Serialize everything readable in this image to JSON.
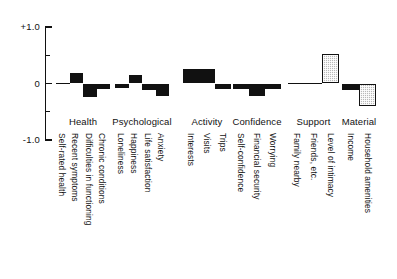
{
  "chart_data": {
    "type": "bar",
    "title": "",
    "subtitle": "",
    "xlabel": "",
    "ylabel": "",
    "ylim": [
      -1.0,
      1.0
    ],
    "grid": false,
    "legend": "none",
    "y_ticks": [
      {
        "value": 1.0,
        "label": "+1.0",
        "major": true
      },
      {
        "value": 0.5,
        "label": "",
        "major": false
      },
      {
        "value": 0.0,
        "label": "0",
        "major": true
      },
      {
        "value": -0.5,
        "label": "",
        "major": false
      },
      {
        "value": -1.0,
        "label": "-1.0",
        "major": true
      }
    ],
    "groups": [
      {
        "name": "Health",
        "label": "Health",
        "bars": [
          {
            "label": "Self-rated health",
            "value": 0.0,
            "style": "solid"
          },
          {
            "label": "Recent symptoms",
            "value": 0.18,
            "style": "solid"
          },
          {
            "label": "Difficulties in functioning",
            "value": -0.24,
            "style": "solid"
          },
          {
            "label": "Chronic conditions",
            "value": -0.1,
            "style": "solid"
          }
        ]
      },
      {
        "name": "Psychological",
        "label": "Psychological",
        "bars": [
          {
            "label": "Loneliness",
            "value": -0.08,
            "style": "solid"
          },
          {
            "label": "Happiness",
            "value": 0.15,
            "style": "solid"
          },
          {
            "label": "Life satisfaction",
            "value": -0.12,
            "style": "solid"
          },
          {
            "label": "Anxiety",
            "value": -0.22,
            "style": "solid"
          }
        ]
      },
      {
        "name": "Activity",
        "label": "Activity",
        "bars": [
          {
            "label": "Interests",
            "value": 0.26,
            "style": "solid"
          },
          {
            "label": "Visits",
            "value": 0.26,
            "style": "solid"
          },
          {
            "label": "Trips",
            "value": -0.1,
            "style": "solid"
          }
        ]
      },
      {
        "name": "Confidence",
        "label": "Confidence",
        "bars": [
          {
            "label": "Self-confidence",
            "value": -0.1,
            "style": "solid"
          },
          {
            "label": "Financial security",
            "value": -0.22,
            "style": "solid"
          },
          {
            "label": "Worrying",
            "value": -0.1,
            "style": "solid"
          }
        ]
      },
      {
        "name": "Support",
        "label": "Support",
        "bars": [
          {
            "label": "Family nearby",
            "value": 0.0,
            "style": "solid"
          },
          {
            "label": "Friends, etc.",
            "value": 0.0,
            "style": "solid"
          },
          {
            "label": "Level of intimacy",
            "value": 0.52,
            "style": "hatched"
          }
        ]
      },
      {
        "name": "Material",
        "label": "Material",
        "bars": [
          {
            "label": "Income",
            "value": -0.12,
            "style": "solid"
          },
          {
            "label": "Household amenities",
            "value": -0.4,
            "style": "hatched"
          }
        ]
      }
    ]
  }
}
